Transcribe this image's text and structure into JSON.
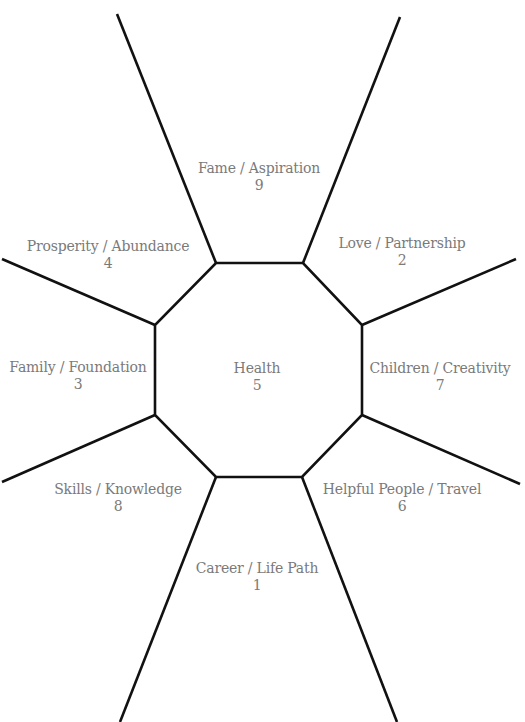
{
  "diagram": {
    "type": "bagua-octagon",
    "line_color": "#111111",
    "text_color": "#7a7a7a",
    "center": {
      "label": "Health",
      "number": "5"
    },
    "zones": [
      {
        "id": "fame",
        "label": "Fame / Aspiration",
        "number": "9",
        "position": "top"
      },
      {
        "id": "love",
        "label": "Love / Partnership",
        "number": "2",
        "position": "top-right"
      },
      {
        "id": "children",
        "label": "Children / Creativity",
        "number": "7",
        "position": "right"
      },
      {
        "id": "helpful",
        "label": "Helpful People / Travel",
        "number": "6",
        "position": "bottom-right"
      },
      {
        "id": "career",
        "label": "Career / Life Path",
        "number": "1",
        "position": "bottom"
      },
      {
        "id": "skills",
        "label": "Skills / Knowledge",
        "number": "8",
        "position": "bottom-left"
      },
      {
        "id": "family",
        "label": "Family / Foundation",
        "number": "3",
        "position": "left"
      },
      {
        "id": "prosperity",
        "label": "Prosperity / Abundance",
        "number": "4",
        "position": "top-left"
      }
    ]
  }
}
